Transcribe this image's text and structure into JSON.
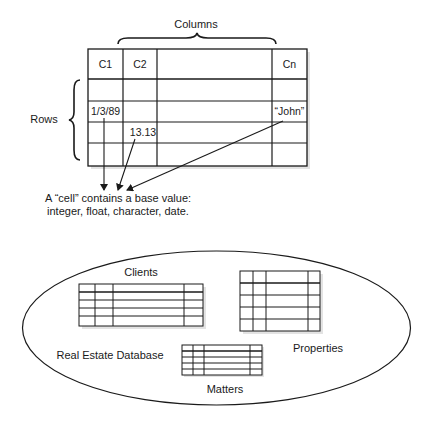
{
  "figure": {
    "columns_label": "Columns",
    "rows_label": "Rows",
    "table": {
      "header": [
        "C1",
        "C2",
        "",
        "Cn"
      ],
      "rows": [
        [
          "",
          "",
          "",
          ""
        ],
        [
          "1/3/89",
          "",
          "",
          "“John”"
        ],
        [
          "",
          "13.13",
          "",
          ""
        ],
        [
          "",
          "",
          "",
          ""
        ]
      ]
    },
    "caption": {
      "line1": "A “cell” contains a base value:",
      "line2": "integer, float, character, date."
    },
    "database": {
      "label": "Real Estate Database",
      "tables": [
        {
          "name": "Clients"
        },
        {
          "name": "Properties"
        },
        {
          "name": "Matters"
        }
      ]
    }
  },
  "colors": {
    "line": "#1a1a1a",
    "shadow": "#d9d9d9",
    "background": "#ffffff"
  }
}
